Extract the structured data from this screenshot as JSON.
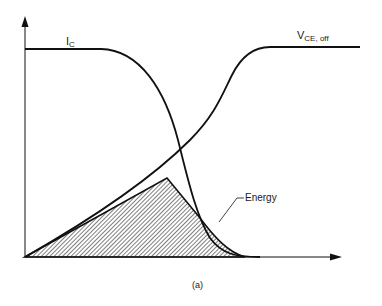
{
  "figure": {
    "caption": "(a)",
    "type": "switching-waveform-diagram"
  },
  "curves": {
    "collector_current": {
      "label_main": "I",
      "label_sub": "C"
    },
    "collector_emitter_voltage": {
      "label_main": "V",
      "label_sub": "CE, off"
    }
  },
  "annotations": {
    "energy": {
      "label": "Energy"
    }
  },
  "axes": {
    "x": {
      "has_arrow": true,
      "label": ""
    },
    "y": {
      "has_arrow": true,
      "label": ""
    }
  },
  "colors": {
    "line": "#111111",
    "hatch": "#333333",
    "background": "#ffffff"
  }
}
